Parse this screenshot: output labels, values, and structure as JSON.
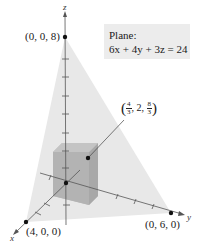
{
  "diagram": {
    "type": "3d-coordinate-plot",
    "axes": {
      "x_label": "x",
      "y_label": "y",
      "z_label": "z"
    },
    "plane_label": {
      "title": "Plane:",
      "equation": "6x + 4y + 3z = 24"
    },
    "points": [
      {
        "label": "(0, 0, 8)",
        "coords": [
          0,
          0,
          8
        ]
      },
      {
        "label": "(4, 0, 0)",
        "coords": [
          4,
          0,
          0
        ]
      },
      {
        "label": "(0, 6, 0)",
        "coords": [
          0,
          6,
          0
        ]
      }
    ],
    "box_corner": {
      "x_num": "4",
      "x_den": "3",
      "y": "2",
      "z_num": "8",
      "z_den": "3",
      "coords_text": "(4/3, 2, 8/3)"
    },
    "colors": {
      "plane_fill": "#e6e6e6",
      "box_fill": "#b5b5b5",
      "axis": "#555555",
      "point": "#111111",
      "label_bg": "#ececec"
    }
  }
}
